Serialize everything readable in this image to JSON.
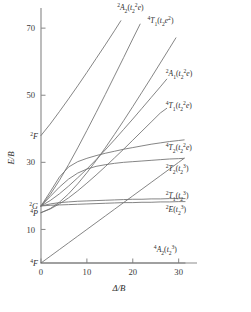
{
  "figure": {
    "name": "tanabe-sugano-diagram-d3",
    "background": "#ffffff",
    "line_color": "#6f6f6f",
    "axis_color": "#8c8c8c",
    "text_color": "#2e2e2e"
  },
  "axes": {
    "x": {
      "label": "Δ/B",
      "ticks": [
        "0",
        "10",
        "20",
        "30"
      ],
      "tick_values": [
        0,
        10,
        20,
        30
      ],
      "range": [
        0,
        34
      ]
    },
    "y": {
      "label": "E/B",
      "ticks": [
        "10",
        "30",
        "50",
        "70"
      ],
      "tick_values": [
        10,
        30,
        50,
        70
      ],
      "range": [
        0,
        76
      ]
    }
  },
  "free_ion_terms": [
    {
      "label": "2F",
      "super": "2",
      "letter": "F",
      "value": 38.0
    },
    {
      "label": "2G",
      "super": "2",
      "letter": "G",
      "value": 17.0
    },
    {
      "label": "4P",
      "super": "4",
      "letter": "P",
      "value": 15.0
    },
    {
      "label": "4F",
      "super": "4",
      "letter": "F",
      "value": 0.0
    }
  ],
  "chart_data": {
    "type": "line",
    "title": "",
    "xlabel": "Δ/B",
    "ylabel": "E/B",
    "xlim": [
      0,
      34
    ],
    "ylim": [
      0,
      76
    ],
    "grid": false,
    "legend": "right-inline-labels",
    "series": [
      {
        "name": "2A2(t2^2 e)",
        "super": "2",
        "term": "A",
        "term_sub": "2",
        "config": "t2^2e",
        "label_x": 16.6,
        "label_y": 75.5,
        "points": [
          [
            0,
            17.0
          ],
          [
            2,
            20.4
          ],
          [
            4,
            24.6
          ],
          [
            6,
            29.3
          ],
          [
            8,
            34.3
          ],
          [
            10,
            39.5
          ],
          [
            12,
            44.8
          ],
          [
            14,
            50.2
          ],
          [
            16,
            55.7
          ],
          [
            18,
            61.2
          ],
          [
            20,
            66.8
          ],
          [
            21.6,
            71.2
          ]
        ]
      },
      {
        "name": "4T1(t2 e^2)",
        "super": "4",
        "term": "T",
        "term_sub": "1",
        "config": "t2e^2",
        "label_x": 23.2,
        "label_y": 71.5,
        "points": [
          [
            0,
            15.0
          ],
          [
            2,
            16.2
          ],
          [
            4,
            18.1
          ],
          [
            6,
            20.6
          ],
          [
            8,
            23.6
          ],
          [
            10,
            26.9
          ],
          [
            12,
            30.5
          ],
          [
            14,
            34.3
          ],
          [
            16,
            38.3
          ],
          [
            18,
            42.4
          ],
          [
            20,
            46.6
          ],
          [
            22,
            50.9
          ],
          [
            24,
            55.2
          ],
          [
            26,
            59.6
          ],
          [
            28,
            64.0
          ],
          [
            29.4,
            67.1
          ]
        ]
      },
      {
        "name": "2A1(t2^2 e)",
        "super": "2",
        "term": "A",
        "term_sub": "1",
        "config": "t2^2e",
        "label_x": 27.2,
        "label_y": 55.8,
        "points": [
          [
            0,
            17.0
          ],
          [
            2,
            18.6
          ],
          [
            4,
            20.6
          ],
          [
            6,
            22.9
          ],
          [
            8,
            25.4
          ],
          [
            10,
            28.0
          ],
          [
            12,
            30.8
          ],
          [
            14,
            33.7
          ],
          [
            16,
            36.7
          ],
          [
            18,
            39.8
          ],
          [
            20,
            42.9
          ],
          [
            22,
            46.1
          ],
          [
            24,
            49.3
          ],
          [
            26,
            52.5
          ],
          [
            27.4,
            54.8
          ]
        ]
      },
      {
        "name": "4T1(t2^2 e)",
        "super": "4",
        "term": "T",
        "term_sub": "1",
        "config": "t2^2e",
        "label_x": 27.2,
        "label_y": 46.3,
        "points": [
          [
            0,
            15.0
          ],
          [
            2,
            16.1
          ],
          [
            4,
            17.6
          ],
          [
            6,
            19.4
          ],
          [
            8,
            21.5
          ],
          [
            10,
            23.8
          ],
          [
            12,
            26.2
          ],
          [
            14,
            28.7
          ],
          [
            16,
            31.3
          ],
          [
            18,
            33.9
          ],
          [
            20,
            36.6
          ],
          [
            22,
            39.3
          ],
          [
            24,
            42.0
          ],
          [
            26,
            44.7
          ],
          [
            27.4,
            46.1
          ]
        ]
      },
      {
        "name": "4T2(t2^2 e)",
        "super": "4",
        "term": "T",
        "term_sub": "2",
        "config": "t2^2e",
        "label_x": 27.2,
        "label_y": 33.8,
        "points": [
          [
            0,
            0.0
          ],
          [
            2,
            2.0
          ],
          [
            4,
            4.0
          ],
          [
            6,
            6.0
          ],
          [
            8,
            8.0
          ],
          [
            10,
            10.0
          ],
          [
            12,
            12.0
          ],
          [
            14,
            14.0
          ],
          [
            16,
            16.0
          ],
          [
            18,
            18.0
          ],
          [
            20,
            20.0
          ],
          [
            22,
            22.0
          ],
          [
            24,
            24.0
          ],
          [
            26,
            26.0
          ],
          [
            28,
            28.0
          ],
          [
            30,
            30.0
          ],
          [
            31.2,
            31.2
          ]
        ]
      },
      {
        "name": "2T2(t2^3)",
        "super": "2",
        "term": "T",
        "term_sub": "2",
        "config": "t2^3",
        "label_x": 27.2,
        "label_y": 27.5,
        "points": [
          [
            0,
            17.0
          ],
          [
            2,
            19.8
          ],
          [
            4,
            22.6
          ],
          [
            6,
            25.0
          ],
          [
            8,
            26.8
          ],
          [
            10,
            28.0
          ],
          [
            12,
            28.8
          ],
          [
            14,
            29.3
          ],
          [
            16,
            29.7
          ],
          [
            18,
            30.0
          ],
          [
            20,
            30.2
          ],
          [
            22,
            30.4
          ],
          [
            24,
            30.6
          ],
          [
            26,
            30.8
          ],
          [
            28,
            31.0
          ],
          [
            30,
            31.1
          ],
          [
            31.2,
            31.2
          ]
        ]
      },
      {
        "name": "2T1(t2^3)",
        "super": "2",
        "term": "T",
        "term_sub": "1",
        "config": "t2^3",
        "label_x": 27.2,
        "label_y": 19.4,
        "points": [
          [
            0,
            17.0
          ],
          [
            2,
            17.6
          ],
          [
            4,
            18.0
          ],
          [
            6,
            18.2
          ],
          [
            8,
            18.4
          ],
          [
            10,
            18.5
          ],
          [
            12,
            18.6
          ],
          [
            14,
            18.7
          ],
          [
            16,
            18.8
          ],
          [
            18,
            18.9
          ],
          [
            20,
            19.0
          ],
          [
            22,
            19.0
          ],
          [
            24,
            19.1
          ],
          [
            26,
            19.1
          ],
          [
            28,
            19.2
          ],
          [
            30,
            19.2
          ],
          [
            31.4,
            19.2
          ]
        ]
      },
      {
        "name": "2E(t2^3)",
        "super": "2",
        "term": "E",
        "term_sub": "",
        "config": "t2^3",
        "label_x": 27.2,
        "label_y": 15.2,
        "points": [
          [
            0,
            17.0
          ],
          [
            2,
            17.2
          ],
          [
            4,
            17.3
          ],
          [
            6,
            17.4
          ],
          [
            8,
            17.5
          ],
          [
            10,
            17.6
          ],
          [
            12,
            17.7
          ],
          [
            14,
            17.8
          ],
          [
            16,
            17.9
          ],
          [
            18,
            18.0
          ],
          [
            20,
            18.0
          ],
          [
            22,
            18.1
          ],
          [
            24,
            18.1
          ],
          [
            26,
            18.2
          ],
          [
            28,
            18.2
          ],
          [
            30,
            18.3
          ],
          [
            31.4,
            18.3
          ]
        ]
      },
      {
        "name": "4A2(t2^3)",
        "super": "4",
        "term": "A",
        "term_sub": "2",
        "config": "t2^3",
        "label_x": 24.6,
        "label_y": 3.2,
        "points": [
          [
            0,
            0.0
          ],
          [
            31.4,
            0.0
          ]
        ]
      },
      {
        "name": "2F-branch",
        "super": "2",
        "term": "",
        "term_sub": "",
        "config": "",
        "label_x": null,
        "label_y": null,
        "points": [
          [
            0,
            38.0
          ],
          [
            2,
            41.4
          ],
          [
            4,
            45.1
          ],
          [
            6,
            48.9
          ],
          [
            8,
            52.8
          ],
          [
            10,
            56.8
          ],
          [
            12,
            60.9
          ],
          [
            14,
            65.0
          ],
          [
            16,
            69.2
          ],
          [
            17.4,
            72.2
          ]
        ]
      },
      {
        "name": "2T-steep-branch",
        "super": "2",
        "term": "",
        "term_sub": "",
        "config": "",
        "label_x": null,
        "label_y": null,
        "points": [
          [
            0,
            17.0
          ],
          [
            2,
            21.2
          ],
          [
            4,
            25.6
          ],
          [
            6,
            28.6
          ],
          [
            8,
            30.2
          ],
          [
            10,
            31.2
          ],
          [
            12,
            32.0
          ],
          [
            14,
            32.7
          ],
          [
            16,
            33.3
          ],
          [
            18,
            33.9
          ],
          [
            20,
            34.4
          ],
          [
            22,
            34.9
          ],
          [
            24,
            35.4
          ],
          [
            26,
            35.8
          ],
          [
            28,
            36.2
          ],
          [
            30,
            36.5
          ],
          [
            31.2,
            36.7
          ]
        ]
      }
    ]
  }
}
